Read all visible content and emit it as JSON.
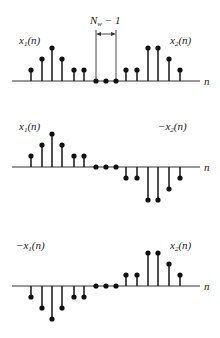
{
  "figure": {
    "n_label": "n",
    "gap_label_main": "N",
    "gap_label_sub": "w",
    "gap_label_rest": " − 1",
    "sample_x": [
      31,
      42,
      52,
      62,
      74,
      84,
      96,
      106,
      116,
      126,
      137,
      148,
      158,
      169,
      180
    ],
    "unit_px": 11,
    "axis_x_start": 12,
    "axis_x_end": 200
  },
  "panels": [
    {
      "id": "panel-1",
      "axis_y": 81,
      "left_label": {
        "prefix": "",
        "name": "x",
        "sub": "1",
        "arg": "(n)"
      },
      "right_label": {
        "prefix": "",
        "name": "x",
        "sub": "2",
        "arg": "(n)"
      },
      "values": [
        1,
        2,
        3,
        2,
        1,
        1,
        0,
        0,
        0,
        1,
        1,
        3,
        3,
        2,
        1
      ]
    },
    {
      "id": "panel-2",
      "axis_y": 167,
      "left_label": {
        "prefix": "",
        "name": "x",
        "sub": "1",
        "arg": "(n)"
      },
      "right_label": {
        "prefix": "−",
        "name": "x",
        "sub": "2",
        "arg": "(n)"
      },
      "values": [
        1,
        2,
        3,
        2,
        1,
        1,
        0,
        0,
        0,
        -1,
        -1,
        -3,
        -3,
        -2,
        -1
      ]
    },
    {
      "id": "panel-3",
      "axis_y": 286,
      "left_label": {
        "prefix": "−",
        "name": "x",
        "sub": "1",
        "arg": "(n)"
      },
      "right_label": {
        "prefix": "",
        "name": "x",
        "sub": "2",
        "arg": "(n)"
      },
      "values": [
        -1,
        -2,
        -3,
        -2,
        -1,
        -1,
        0,
        0,
        0,
        1,
        1,
        3,
        3,
        2,
        1
      ]
    }
  ],
  "chart_data": {
    "type": "stem",
    "title": "",
    "xlabel": "n",
    "ylabel": "",
    "annotations": [
      "N_w − 1 (gap of zero samples between x1(n) and x2(n))"
    ],
    "x": [
      0,
      1,
      2,
      3,
      4,
      5,
      6,
      7,
      8,
      9,
      10,
      11,
      12,
      13,
      14
    ],
    "series": [
      {
        "name": "x1(n) + x2(n)",
        "values": [
          1,
          2,
          3,
          2,
          1,
          1,
          0,
          0,
          0,
          1,
          1,
          3,
          3,
          2,
          1
        ]
      },
      {
        "name": "x1(n) − x2(n)",
        "values": [
          1,
          2,
          3,
          2,
          1,
          1,
          0,
          0,
          0,
          -1,
          -1,
          -3,
          -3,
          -2,
          -1
        ]
      },
      {
        "name": "−x1(n) + x2(n)",
        "values": [
          -1,
          -2,
          -3,
          -2,
          -1,
          -1,
          0,
          0,
          0,
          1,
          1,
          3,
          3,
          2,
          1
        ]
      }
    ],
    "legend": [
      "x1(n)",
      "x2(n)",
      "−x2(n)",
      "−x1(n)"
    ],
    "grid": false
  }
}
